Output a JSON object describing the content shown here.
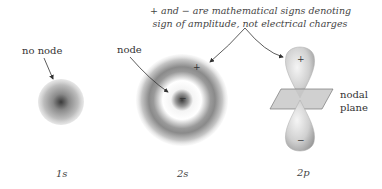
{
  "annotation": {
    "line1": "+ and − are mathematical signs denoting",
    "line2": "sign of amplitude, not electrical charges"
  },
  "orbitals": [
    {
      "id": "1s",
      "caption": "1s",
      "label": "no node"
    },
    {
      "id": "2s",
      "caption": "2s",
      "label": "node",
      "sign_outer": "+",
      "sign_inner": "−"
    },
    {
      "id": "2p",
      "caption": "2p",
      "label_line1": "nodal",
      "label_line2": "plane",
      "sign_top": "+",
      "sign_bottom": "−"
    }
  ]
}
